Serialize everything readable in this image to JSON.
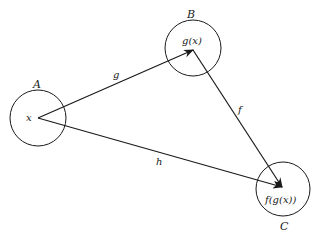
{
  "diagram": {
    "stroke_color": "#1a1a1a",
    "sets": [
      {
        "id": "A",
        "label": "A",
        "element": "x"
      },
      {
        "id": "B",
        "label": "B",
        "element": "g(x)"
      },
      {
        "id": "C",
        "label": "C",
        "element": "f(g(x))"
      }
    ],
    "arrows": [
      {
        "id": "g",
        "label": "g",
        "from": "A",
        "to": "B"
      },
      {
        "id": "f",
        "label": "f",
        "from": "B",
        "to": "C"
      },
      {
        "id": "h",
        "label": "h",
        "from": "A",
        "to": "C"
      }
    ]
  }
}
